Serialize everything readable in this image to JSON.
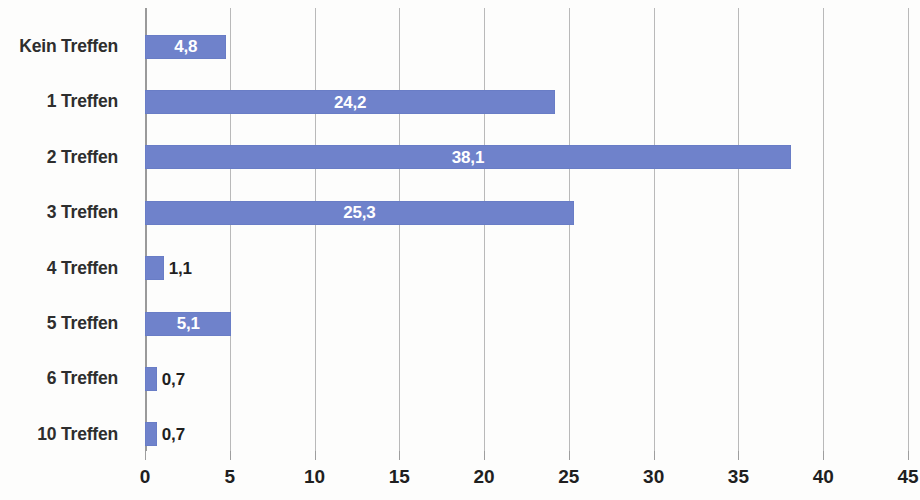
{
  "chart_data": {
    "type": "bar",
    "orientation": "horizontal",
    "title": "",
    "subtitle": "",
    "xlabel": "",
    "ylabel": "",
    "xlim": [
      0,
      45
    ],
    "xticks": [
      0,
      5,
      10,
      15,
      20,
      25,
      30,
      35,
      40,
      45
    ],
    "xtick_labels": [
      "0",
      "5",
      "10",
      "15",
      "20",
      "25",
      "30",
      "35",
      "40",
      "45"
    ],
    "grid": true,
    "grid_axis": "x",
    "legend": false,
    "legend_position": "none",
    "decimal_separator": ",",
    "categories": [
      "Kein Treffen",
      "1 Treffen",
      "2 Treffen",
      "3 Treffen",
      "4 Treffen",
      "5 Treffen",
      "6 Treffen",
      "10 Treffen"
    ],
    "values": [
      4.8,
      24.2,
      38.1,
      25.3,
      1.1,
      5.1,
      0.7,
      0.7
    ],
    "data_labels": [
      "4,8",
      "24,2",
      "38,1",
      "25,3",
      "1,1",
      "5,1",
      "0,7",
      "0,7"
    ],
    "label_placement": [
      "inside",
      "inside",
      "inside",
      "inside",
      "outside",
      "inside",
      "outside",
      "outside"
    ],
    "series": [
      {
        "name": "",
        "values": [
          4.8,
          24.2,
          38.1,
          25.3,
          1.1,
          5.1,
          0.7,
          0.7
        ]
      }
    ]
  },
  "style": {
    "bar_color": "#6F82CB",
    "inside_label_color": "#FFFFFF",
    "outside_label_color": "#1F1F1F",
    "category_label_color": "#2E2E2E",
    "gridline_color": "#B9B9B9",
    "axis_color": "#9A9A9A",
    "background_color": "#FDFDFC"
  }
}
